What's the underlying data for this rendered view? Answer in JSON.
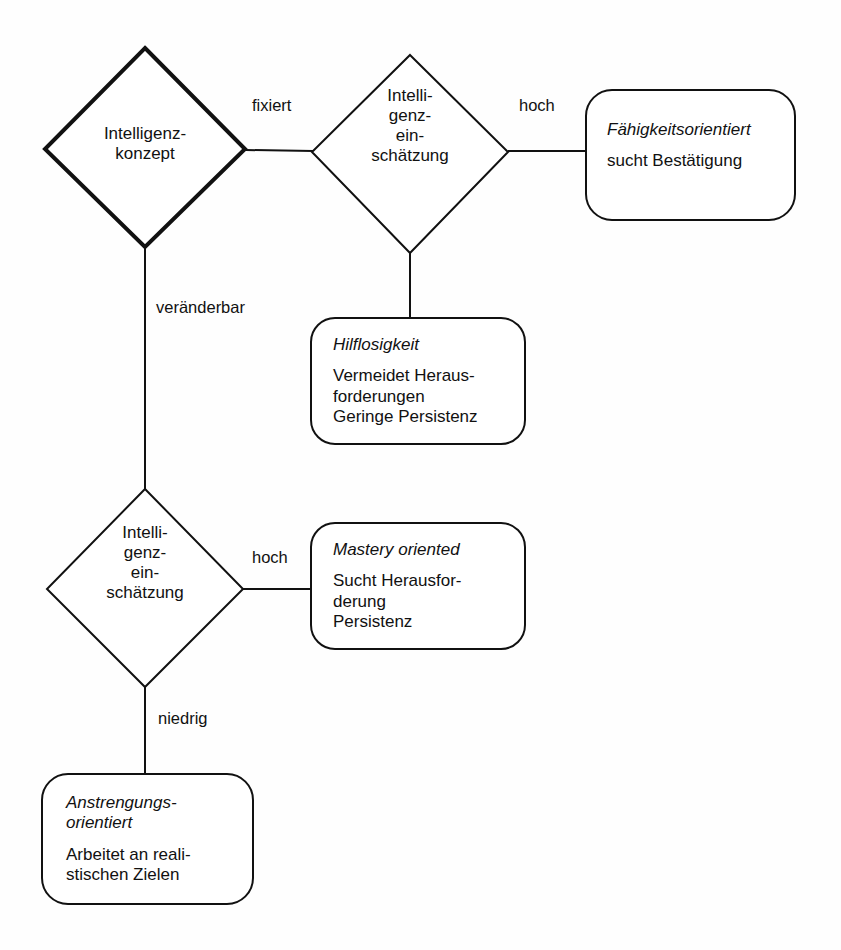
{
  "diagram": {
    "background_color": "#fefefe",
    "stroke_color": "#111111",
    "nodes": {
      "root_decision": {
        "shape": "diamond",
        "label": "Intelligenz-\nkonzept",
        "emphasis": "bold-outline"
      },
      "assessment_fixed": {
        "shape": "diamond",
        "label": "Intelli-\ngenz-\nein-\nschätzung"
      },
      "assessment_malleable": {
        "shape": "diamond",
        "label": "Intelli-\ngenz-\nein-\nschätzung"
      },
      "outcome_ability": {
        "shape": "rounded-box",
        "title": "Fähigkeitsorientiert",
        "body": "sucht Bestätigung"
      },
      "outcome_helpless": {
        "shape": "rounded-box",
        "title": "Hilflosigkeit",
        "body": "Vermeidet Heraus-\nforderungen\nGeringe Persistenz"
      },
      "outcome_mastery": {
        "shape": "rounded-box",
        "title": "Mastery oriented",
        "body": "Sucht Herausfor-\nderung\nPersistenz"
      },
      "outcome_effort": {
        "shape": "rounded-box",
        "title": "Anstrengungs-\norientiert",
        "body": "Arbeitet an reali-\nstischen Zielen"
      }
    },
    "edge_labels": {
      "fixed": "fixiert",
      "malleable": "veränderbar",
      "high_fixed": "hoch",
      "high_malleable": "hoch",
      "low_malleable": "niedrig"
    }
  }
}
